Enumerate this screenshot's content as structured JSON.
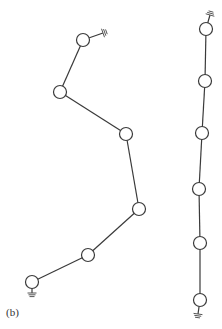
{
  "figure": {
    "label": "(b)",
    "label_pos": {
      "x": 6,
      "y": 306
    },
    "node_radius": 6.5,
    "colors": {
      "line": "#3a3a3a",
      "node_fill": "#ffffff",
      "ground": "#555555",
      "background": "#ffffff"
    },
    "chains": [
      {
        "name": "left-chain",
        "nodes": [
          {
            "x": 83,
            "y": 40
          },
          {
            "x": 60,
            "y": 92
          },
          {
            "x": 126,
            "y": 134
          },
          {
            "x": 139,
            "y": 209
          },
          {
            "x": 88,
            "y": 255
          },
          {
            "x": 32,
            "y": 282
          }
        ],
        "grounds": [
          {
            "attach_node": 0,
            "x": 103,
            "y": 33,
            "angle": -20
          },
          {
            "attach_node": 5,
            "x": 32,
            "y": 293,
            "angle": 90
          }
        ]
      },
      {
        "name": "right-chain",
        "nodes": [
          {
            "x": 206,
            "y": 29
          },
          {
            "x": 205,
            "y": 81
          },
          {
            "x": 202,
            "y": 133
          },
          {
            "x": 199,
            "y": 189
          },
          {
            "x": 200,
            "y": 243
          },
          {
            "x": 200,
            "y": 300
          }
        ],
        "grounds": [
          {
            "attach_node": 0,
            "x": 210,
            "y": 15,
            "angle": -75
          },
          {
            "attach_node": 5,
            "x": 198,
            "y": 314,
            "angle": 100
          }
        ]
      }
    ]
  }
}
